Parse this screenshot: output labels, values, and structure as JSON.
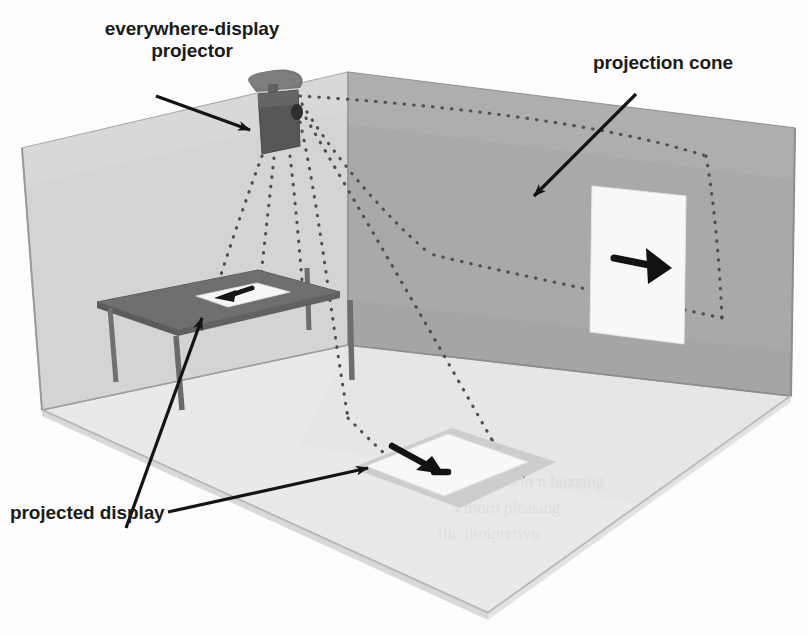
{
  "figure": {
    "type": "isometric-room-illustration"
  },
  "labels": {
    "projector": "everywhere-display\nprojector",
    "cone": "projection cone",
    "display": "projected display"
  },
  "scene": {
    "room": {
      "left_wall_label": "left wall",
      "right_wall_label": "right wall",
      "floor_label": "floor"
    },
    "projector": {
      "name": "ceiling mounted projector",
      "mount": "ceiling mount plate"
    },
    "table": {
      "name": "table"
    },
    "displays": [
      {
        "id": "table-display",
        "surface": "table",
        "arrow": "left"
      },
      {
        "id": "wall-display",
        "surface": "right wall",
        "arrow": "right"
      },
      {
        "id": "floor-display",
        "surface": "floor",
        "arrow": "down-right"
      }
    ],
    "cone": {
      "name": "projection cone",
      "style": "dotted"
    }
  },
  "colors": {
    "left_wall": "#d4d4d4",
    "right_wall": "#a9a9a9",
    "floor": "#e9e9e9",
    "table_top": "#6e6e6e",
    "table_leg": "#707070",
    "projector_body": "#5a5a5a",
    "display_white": "#f7f7f7",
    "ink": "#1b1b1b",
    "dotted": "#585858",
    "shadow": "#cdcdcd"
  },
  "ghost_text": [
    {
      "text": "shadow  bleed  text",
      "x": 470,
      "y": 486
    },
    {
      "text": "scanned  page  ghost",
      "x": 455,
      "y": 512
    },
    {
      "text": "faint  reverse  print",
      "x": 440,
      "y": 536
    }
  ]
}
